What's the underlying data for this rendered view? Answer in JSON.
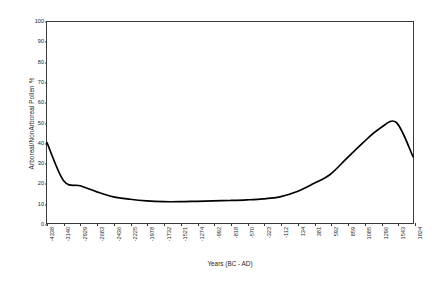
{
  "chart_data": {
    "type": "line",
    "title": "",
    "xlabel": "Years (BC - AD)",
    "ylabel": "Arboreal/NonArboreal Pollen %",
    "xlim": [
      -4338,
      1824
    ],
    "ylim": [
      0,
      100
    ],
    "grid": false,
    "legend": "none",
    "y_ticks": [
      0,
      10,
      20,
      30,
      40,
      50,
      60,
      70,
      80,
      90,
      100
    ],
    "categories": [
      "-4338",
      "-3140",
      "-2929",
      "-2683",
      "-2436",
      "-2225",
      "-1978",
      "-1732",
      "-1521",
      "-1274",
      "-992",
      "-818",
      "-570",
      "-323",
      "-112",
      "134",
      "381",
      "592",
      "859",
      "1085",
      "1296",
      "1543",
      "1824"
    ],
    "x": [
      -4338,
      -3140,
      -2929,
      -2683,
      -2436,
      -2225,
      -1978,
      -1732,
      -1521,
      -1274,
      -992,
      -818,
      -570,
      -323,
      -112,
      134,
      381,
      592,
      859,
      1085,
      1296,
      1543,
      1824
    ],
    "values": [
      40,
      21,
      18.5,
      15.5,
      13,
      11.8,
      11,
      10.6,
      10.6,
      10.8,
      11,
      11.2,
      11.5,
      12,
      13,
      15.5,
      19.5,
      24,
      32,
      40,
      47,
      50,
      33
    ],
    "series": [
      {
        "name": "Arboreal/NonArboreal Pollen %",
        "color": "#000000",
        "values": [
          40,
          21,
          18.5,
          15.5,
          13,
          11.8,
          11,
          10.6,
          10.6,
          10.8,
          11,
          11.2,
          11.5,
          12,
          13,
          15.5,
          19.5,
          24,
          32,
          40,
          47,
          50,
          33
        ]
      }
    ],
    "annotations": []
  }
}
